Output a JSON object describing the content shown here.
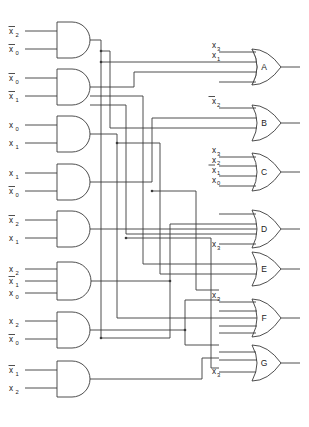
{
  "figure": {
    "caption": ""
  },
  "and_gates": [
    {
      "id": "and1",
      "inputs": [
        {
          "name": "x2",
          "base": "x",
          "sub": "2",
          "bar": true
        },
        {
          "name": "x0",
          "base": "x",
          "sub": "0",
          "bar": true
        }
      ]
    },
    {
      "id": "and2",
      "inputs": [
        {
          "name": "x0",
          "base": "x",
          "sub": "0",
          "bar": true
        },
        {
          "name": "x1",
          "base": "x",
          "sub": "1",
          "bar": true
        }
      ]
    },
    {
      "id": "and3",
      "inputs": [
        {
          "name": "x0",
          "base": "x",
          "sub": "0",
          "bar": false
        },
        {
          "name": "x1",
          "base": "x",
          "sub": "1",
          "bar": false
        }
      ]
    },
    {
      "id": "and4",
      "inputs": [
        {
          "name": "x1",
          "base": "x",
          "sub": "1",
          "bar": false
        },
        {
          "name": "x0",
          "base": "x",
          "sub": "0",
          "bar": true
        }
      ]
    },
    {
      "id": "and5",
      "inputs": [
        {
          "name": "x2",
          "base": "x",
          "sub": "2",
          "bar": true
        },
        {
          "name": "x1",
          "base": "x",
          "sub": "1",
          "bar": false
        }
      ]
    },
    {
      "id": "and6",
      "inputs": [
        {
          "name": "x2",
          "base": "x",
          "sub": "2",
          "bar": false
        },
        {
          "name": "x1",
          "base": "x",
          "sub": "1",
          "bar": true
        },
        {
          "name": "x0",
          "base": "x",
          "sub": "0",
          "bar": false
        }
      ]
    },
    {
      "id": "and7",
      "inputs": [
        {
          "name": "x2",
          "base": "x",
          "sub": "2",
          "bar": false
        },
        {
          "name": "x0",
          "base": "x",
          "sub": "0",
          "bar": true
        }
      ]
    },
    {
      "id": "and8",
      "inputs": [
        {
          "name": "x1",
          "base": "x",
          "sub": "1",
          "bar": true
        },
        {
          "name": "x2",
          "base": "x",
          "sub": "2",
          "bar": false
        }
      ]
    }
  ],
  "or_gates": [
    {
      "id": "orA",
      "letter": "A",
      "direct_inputs": [
        {
          "base": "x",
          "sub": "3",
          "bar": false
        },
        {
          "base": "x",
          "sub": "1",
          "bar": false
        }
      ],
      "bus_inputs": 2
    },
    {
      "id": "orB",
      "letter": "B",
      "direct_inputs": [
        {
          "base": "x",
          "sub": "2",
          "bar": true
        }
      ],
      "bus_inputs": 2
    },
    {
      "id": "orC",
      "letter": "C",
      "direct_inputs": [
        {
          "base": "x",
          "sub": "3",
          "bar": false
        },
        {
          "base": "x",
          "sub": "2",
          "bar": false
        },
        {
          "base": "x",
          "sub": "1",
          "bar": true
        },
        {
          "base": "x",
          "sub": "0",
          "bar": false
        }
      ],
      "bus_inputs": 0
    },
    {
      "id": "orD",
      "letter": "D",
      "direct_inputs": [
        {
          "base": "x",
          "sub": "3",
          "bar": false
        }
      ],
      "bus_inputs": 3
    },
    {
      "id": "orE",
      "letter": "E",
      "direct_inputs": [],
      "bus_inputs": 2
    },
    {
      "id": "orF",
      "letter": "F",
      "direct_inputs": [
        {
          "base": "x",
          "sub": "3",
          "bar": false
        }
      ],
      "bus_inputs": 3
    },
    {
      "id": "orG",
      "letter": "G",
      "direct_inputs": [
        {
          "base": "x",
          "sub": "3",
          "bar": false
        }
      ],
      "bus_inputs": 2
    }
  ],
  "colors": {
    "wire": "#3a3a3a",
    "gate_stroke": "#3a3a3a",
    "gate_fill": "#ffffff",
    "text": "#222222",
    "background": "#ffffff"
  }
}
